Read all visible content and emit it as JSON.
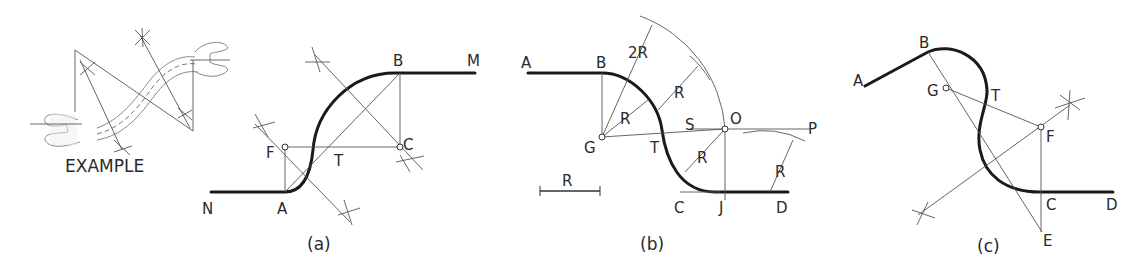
{
  "figure": {
    "example": {
      "caption": "EXAMPLE"
    },
    "panel_a": {
      "caption": "(a)",
      "labels": {
        "N": "N",
        "A": "A",
        "F": "F",
        "T": "T",
        "B": "B",
        "C": "C",
        "M": "M"
      }
    },
    "panel_b": {
      "caption": "(b)",
      "labels": {
        "A": "A",
        "B": "B",
        "G": "G",
        "T": "T",
        "S": "S",
        "O": "O",
        "P": "P",
        "C": "C",
        "J": "J",
        "D": "D",
        "R_scale": "R",
        "R1": "R",
        "R2": "R",
        "R3": "R",
        "R4": "R",
        "twoR": "2R"
      }
    },
    "panel_c": {
      "caption": "(c)",
      "labels": {
        "A": "A",
        "B": "B",
        "G": "G",
        "T": "T",
        "F": "F",
        "C": "C",
        "D": "D",
        "E": "E"
      }
    }
  }
}
